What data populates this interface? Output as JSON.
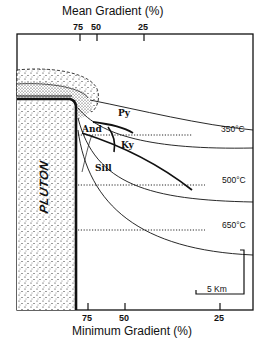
{
  "top_axis": {
    "title": "Mean Gradient (%)",
    "ticks": [
      {
        "label": "75",
        "x": 80
      },
      {
        "label": "50",
        "x": 97
      },
      {
        "label": "25",
        "x": 144
      }
    ]
  },
  "bottom_axis": {
    "title": "Minimum Gradient (%)",
    "ticks": [
      {
        "label": "75",
        "x": 88
      },
      {
        "label": "50",
        "x": 125
      },
      {
        "label": "25",
        "x": 220
      }
    ]
  },
  "body_label": "PLUTON",
  "phase_labels": {
    "py": "Py",
    "and": "And",
    "ky": "Ky",
    "sill": "Sill"
  },
  "isotherms": [
    {
      "label": "350°C"
    },
    {
      "label": "500°C"
    },
    {
      "label": "650°C"
    }
  ],
  "scale_bar": {
    "label": "5 Km"
  },
  "colors": {
    "ink": "#111111",
    "background": "#ffffff"
  }
}
